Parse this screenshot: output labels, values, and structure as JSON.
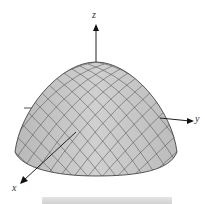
{
  "diagram": {
    "type": "3d-surface",
    "surface_color": "#c8c8c8",
    "mesh_color": "#3a3a3a",
    "axes": {
      "x": {
        "label": "x"
      },
      "y": {
        "label": "y"
      },
      "z": {
        "label": "z"
      }
    }
  }
}
